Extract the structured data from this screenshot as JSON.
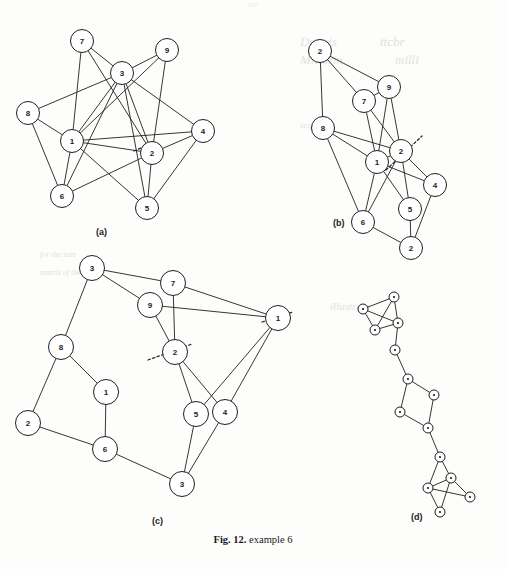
{
  "page": {
    "page_number": "247",
    "caption_figno": "Fig. 12.",
    "caption_text": "example 6"
  },
  "bleed_through": [
    {
      "text": "Dennis",
      "x": 300,
      "y": 34,
      "size": 13
    },
    {
      "text": "ttcbr",
      "x": 380,
      "y": 34,
      "size": 13
    },
    {
      "text": "Millorm",
      "x": 300,
      "y": 52,
      "size": 13
    },
    {
      "text": "milli",
      "x": 395,
      "y": 52,
      "size": 13
    },
    {
      "text": "sequence",
      "x": 300,
      "y": 120,
      "size": 9
    },
    {
      "text": "illustrate",
      "x": 330,
      "y": 300,
      "size": 11
    },
    {
      "text": "for the sum",
      "x": 40,
      "y": 250,
      "size": 8
    },
    {
      "text": "matrix of the",
      "x": 40,
      "y": 268,
      "size": 8
    }
  ],
  "panels": [
    {
      "id": "a",
      "label": "(a)",
      "label_x": 96,
      "label_y": 227,
      "node_radius": 11.5,
      "nodes": [
        {
          "id": "7",
          "x": 82,
          "y": 41
        },
        {
          "id": "9",
          "x": 167,
          "y": 50
        },
        {
          "id": "3",
          "x": 122,
          "y": 73
        },
        {
          "id": "8",
          "x": 28,
          "y": 113
        },
        {
          "id": "4",
          "x": 203,
          "y": 131
        },
        {
          "id": "1",
          "x": 72,
          "y": 141
        },
        {
          "id": "2",
          "x": 152,
          "y": 153
        },
        {
          "id": "6",
          "x": 62,
          "y": 196
        },
        {
          "id": "5",
          "x": 147,
          "y": 208
        }
      ],
      "edges": [
        [
          "7",
          "3"
        ],
        [
          "7",
          "1"
        ],
        [
          "7",
          "2"
        ],
        [
          "9",
          "3"
        ],
        [
          "9",
          "1"
        ],
        [
          "9",
          "2"
        ],
        [
          "3",
          "1"
        ],
        [
          "3",
          "8"
        ],
        [
          "3",
          "2"
        ],
        [
          "3",
          "5"
        ],
        [
          "3",
          "6"
        ],
        [
          "3",
          "4"
        ],
        [
          "8",
          "1"
        ],
        [
          "8",
          "6"
        ],
        [
          "1",
          "2"
        ],
        [
          "1",
          "4"
        ],
        [
          "1",
          "6"
        ],
        [
          "1",
          "5"
        ],
        [
          "2",
          "4"
        ],
        [
          "2",
          "5"
        ],
        [
          "2",
          "6"
        ],
        [
          "4",
          "5"
        ]
      ],
      "dotted_marks": [
        {
          "x1": 134,
          "y1": 151,
          "x2": 150,
          "y2": 144
        }
      ]
    },
    {
      "id": "b",
      "label": "(b)",
      "label_x": 333,
      "label_y": 218,
      "node_radius": 11.5,
      "nodes": [
        {
          "id": "2",
          "x": 320,
          "y": 51
        },
        {
          "id": "9",
          "x": 389,
          "y": 87
        },
        {
          "id": "7",
          "x": 364,
          "y": 101
        },
        {
          "id": "8",
          "x": 323,
          "y": 128
        },
        {
          "id": "1",
          "x": 377,
          "y": 162
        },
        {
          "id": "2b",
          "label": "2",
          "x": 401,
          "y": 151
        },
        {
          "id": "4",
          "x": 435,
          "y": 185
        },
        {
          "id": "5",
          "x": 410,
          "y": 209
        },
        {
          "id": "6",
          "x": 363,
          "y": 222
        },
        {
          "id": "2c",
          "label": "2",
          "x": 411,
          "y": 248
        }
      ],
      "edges": [
        [
          "2",
          "9"
        ],
        [
          "2",
          "8"
        ],
        [
          "2",
          "7"
        ],
        [
          "9",
          "1"
        ],
        [
          "9",
          "2b"
        ],
        [
          "9",
          "7"
        ],
        [
          "7",
          "1"
        ],
        [
          "7",
          "2b"
        ],
        [
          "8",
          "1"
        ],
        [
          "8",
          "2b"
        ],
        [
          "8",
          "6"
        ],
        [
          "1",
          "2b"
        ],
        [
          "1",
          "6"
        ],
        [
          "1",
          "5"
        ],
        [
          "1",
          "4"
        ],
        [
          "2b",
          "4"
        ],
        [
          "2b",
          "5"
        ],
        [
          "2b",
          "6"
        ],
        [
          "4",
          "2c"
        ],
        [
          "5",
          "2c"
        ],
        [
          "6",
          "2c"
        ]
      ],
      "dotted_marks": [
        {
          "x1": 386,
          "y1": 170,
          "x2": 422,
          "y2": 136
        }
      ]
    },
    {
      "id": "c",
      "label": "(c)",
      "label_x": 152,
      "label_y": 516,
      "node_radius": 12.5,
      "nodes": [
        {
          "id": "3t",
          "label": "3",
          "x": 92,
          "y": 268
        },
        {
          "id": "7",
          "x": 173,
          "y": 283
        },
        {
          "id": "9",
          "x": 150,
          "y": 305
        },
        {
          "id": "1r",
          "label": "1",
          "x": 278,
          "y": 318
        },
        {
          "id": "8",
          "x": 61,
          "y": 347
        },
        {
          "id": "2m",
          "label": "2",
          "x": 175,
          "y": 352
        },
        {
          "id": "1",
          "x": 106,
          "y": 392
        },
        {
          "id": "2l",
          "label": "2",
          "x": 28,
          "y": 423
        },
        {
          "id": "5",
          "x": 196,
          "y": 414
        },
        {
          "id": "4",
          "x": 225,
          "y": 412
        },
        {
          "id": "6",
          "x": 105,
          "y": 449
        },
        {
          "id": "3b",
          "label": "3",
          "x": 182,
          "y": 484
        }
      ],
      "edges": [
        [
          "3t",
          "7"
        ],
        [
          "3t",
          "9"
        ],
        [
          "3t",
          "8"
        ],
        [
          "7",
          "1r"
        ],
        [
          "7",
          "2m"
        ],
        [
          "9",
          "1r"
        ],
        [
          "9",
          "2m"
        ],
        [
          "1r",
          "5"
        ],
        [
          "1r",
          "4"
        ],
        [
          "8",
          "1"
        ],
        [
          "8",
          "2l"
        ],
        [
          "2m",
          "5"
        ],
        [
          "2m",
          "4"
        ],
        [
          "1",
          "6"
        ],
        [
          "2l",
          "6"
        ],
        [
          "5",
          "3b"
        ],
        [
          "4",
          "3b"
        ],
        [
          "6",
          "3b"
        ]
      ],
      "dotted_marks": [
        {
          "x1": 148,
          "y1": 360,
          "x2": 192,
          "y2": 344
        },
        {
          "x1": 262,
          "y1": 322,
          "x2": 293,
          "y2": 312
        }
      ]
    },
    {
      "id": "d",
      "label": "(d)",
      "label_x": 411,
      "label_y": 512,
      "node_radius": 5.0,
      "nodes": [
        {
          "id": "n1",
          "label": "",
          "x": 394,
          "y": 297
        },
        {
          "id": "n2",
          "label": "",
          "x": 363,
          "y": 309
        },
        {
          "id": "n3",
          "label": "",
          "x": 398,
          "y": 323
        },
        {
          "id": "n4",
          "label": "",
          "x": 375,
          "y": 330
        },
        {
          "id": "n5",
          "label": "",
          "x": 395,
          "y": 350
        },
        {
          "id": "n6",
          "label": "",
          "x": 408,
          "y": 379
        },
        {
          "id": "n7",
          "label": "",
          "x": 434,
          "y": 395
        },
        {
          "id": "n8",
          "label": "",
          "x": 400,
          "y": 412
        },
        {
          "id": "n9",
          "label": "",
          "x": 428,
          "y": 428
        },
        {
          "id": "n10",
          "label": "",
          "x": 440,
          "y": 457
        },
        {
          "id": "n11",
          "label": "",
          "x": 451,
          "y": 478
        },
        {
          "id": "n12",
          "label": "",
          "x": 428,
          "y": 488
        },
        {
          "id": "n13",
          "label": "",
          "x": 470,
          "y": 497
        },
        {
          "id": "n14",
          "label": "",
          "x": 440,
          "y": 512
        }
      ],
      "edges": [
        [
          "n1",
          "n2"
        ],
        [
          "n1",
          "n3"
        ],
        [
          "n2",
          "n3"
        ],
        [
          "n2",
          "n4"
        ],
        [
          "n3",
          "n4"
        ],
        [
          "n3",
          "n5"
        ],
        [
          "n4",
          "n1"
        ],
        [
          "n5",
          "n6"
        ],
        [
          "n6",
          "n7"
        ],
        [
          "n6",
          "n8"
        ],
        [
          "n7",
          "n9"
        ],
        [
          "n8",
          "n9"
        ],
        [
          "n9",
          "n10"
        ],
        [
          "n10",
          "n11"
        ],
        [
          "n10",
          "n12"
        ],
        [
          "n11",
          "n12"
        ],
        [
          "n11",
          "n13"
        ],
        [
          "n12",
          "n13"
        ],
        [
          "n12",
          "n14"
        ],
        [
          "n11",
          "n14"
        ]
      ],
      "dotted_marks": []
    }
  ],
  "style": {
    "stroke": "#1f1f1f",
    "node_fill": "#ffffff",
    "dotted": "#2a2a2a"
  }
}
